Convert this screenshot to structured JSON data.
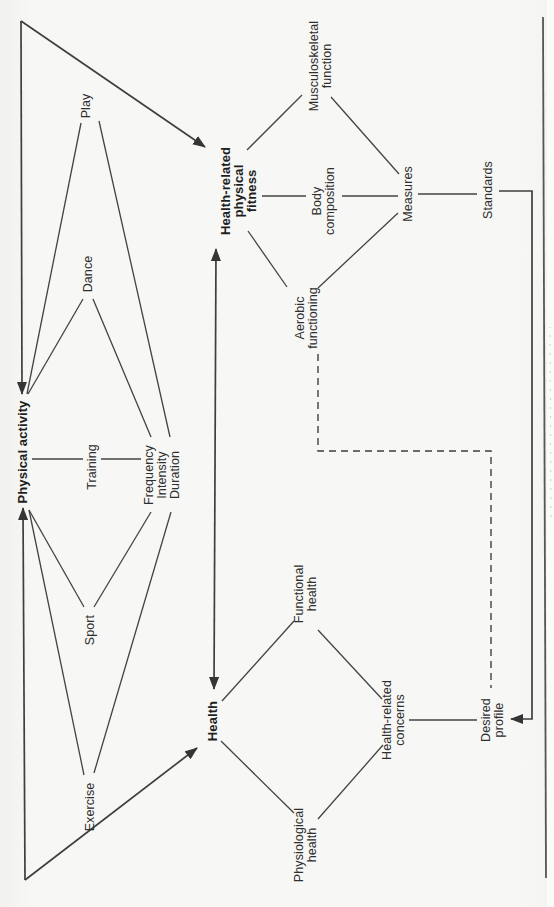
{
  "figure": {
    "type": "flow-diagram",
    "orientation": "rotated-90-ccw",
    "nodes": {
      "physical_activity": "Physical activity",
      "exercise": "Exercise",
      "sport": "Sport",
      "dance": "Dance",
      "play": "Play",
      "training": "Training",
      "frequency_intensity_duration": "Frequency\nIntensity\nDuration",
      "health_related_physical_fitness": "Health-related\nphysical\nfitness",
      "aerobic_functioning": "Aerobic\nfunctioning",
      "body_composition": "Body\ncomposition",
      "musculoskeletal_function": "Musculoskeletal\nfunction",
      "measures": "Measures",
      "standards": "Standards",
      "health": "Health",
      "functional_health": "Functional\nhealth",
      "physiological_health": "Physiological\nhealth",
      "health_related_concerns": "Health-related\nconcerns",
      "desired_profile": "Desired\nprofile"
    },
    "colors": {
      "line": "#3f3f3f",
      "arrow": "#353535",
      "text": "#2e2e2e",
      "background": "#f7f7f5",
      "page_edge": "#565656"
    }
  }
}
